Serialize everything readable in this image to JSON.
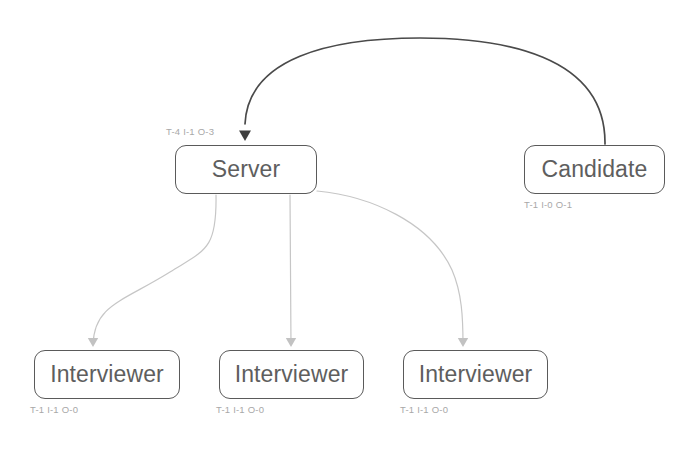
{
  "diagram": {
    "background_color": "#ffffff",
    "node_border_color": "#5a5a5a",
    "node_text_color": "#5e5e5e",
    "stat_text_color": "#a8a8a8",
    "primary_edge_color": "#4a4a4a",
    "secondary_edge_color": "#c6c6c6",
    "nodes": [
      {
        "id": "server",
        "label": "Server",
        "stat": "T-4 I-1 O-3",
        "x": 175,
        "y": 145,
        "width": 142,
        "height": 49,
        "stat_x": 166,
        "stat_y": 127
      },
      {
        "id": "candidate",
        "label": "Candidate",
        "stat": "T-1 I-0 O-1",
        "x": 524,
        "y": 145,
        "width": 141,
        "height": 49,
        "stat_x": 524,
        "stat_y": 200
      },
      {
        "id": "interviewer-1",
        "label": "Interviewer",
        "stat": "T-1 I-1 O-0",
        "x": 34,
        "y": 350,
        "width": 146,
        "height": 49,
        "stat_x": 30,
        "stat_y": 405
      },
      {
        "id": "interviewer-2",
        "label": "Interviewer",
        "stat": "T-1 I-1 O-0",
        "x": 219,
        "y": 350,
        "width": 145,
        "height": 49,
        "stat_x": 216,
        "stat_y": 405
      },
      {
        "id": "interviewer-3",
        "label": "Interviewer",
        "stat": "T-1 I-1 O-0",
        "x": 403,
        "y": 350,
        "width": 145,
        "height": 49,
        "stat_x": 400,
        "stat_y": 405
      }
    ],
    "edges": [
      {
        "id": "candidate-to-server",
        "from": "candidate",
        "to": "server",
        "style": "primary",
        "path": "M 605 144 C 606 54 500 38 420 38 C 330 38 248 58 245 124",
        "arrow_x": 245,
        "arrow_y": 141,
        "arrow_color": "#3f3f3f"
      },
      {
        "id": "server-to-interviewer-1",
        "from": "server",
        "to": "interviewer-1",
        "style": "secondary",
        "path": "M 216 195 C 217 250 205 250 170 272 C 122 302 94 305 93 345",
        "arrow_x": 93,
        "arrow_y": 347,
        "arrow_color": "#c2c2c2"
      },
      {
        "id": "server-to-interviewer-2",
        "from": "server",
        "to": "interviewer-2",
        "style": "secondary",
        "path": "M 290 195 L 291 345",
        "arrow_x": 291,
        "arrow_y": 347,
        "arrow_color": "#c2c2c2"
      },
      {
        "id": "server-to-interviewer-3",
        "from": "server",
        "to": "interviewer-3",
        "style": "secondary",
        "path": "M 317 191 C 370 196 430 222 452 270 C 462 293 463 318 463 345",
        "arrow_x": 463,
        "arrow_y": 347,
        "arrow_color": "#c2c2c2"
      }
    ]
  }
}
